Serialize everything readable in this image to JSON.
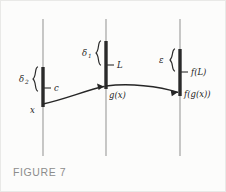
{
  "figure": {
    "caption": "FIGURE 7",
    "background_color": "#fcfcfb",
    "axis_color": "#9a9a9a",
    "bar_color": "#2a2a2a",
    "curve_color": "#262626",
    "caption_color": "#8c8c8c"
  },
  "axes": [
    {
      "id": "domain-axis",
      "x": 42,
      "y_top": 18,
      "y_bottom": 155
    },
    {
      "id": "intermediate-axis",
      "x": 105,
      "y_top": 18,
      "y_bottom": 155
    },
    {
      "id": "range-axis",
      "x": 179,
      "y_top": 18,
      "y_bottom": 155
    }
  ],
  "intervals": [
    {
      "id": "delta2-interval",
      "axis": "domain-axis",
      "x": 42,
      "y_top": 66,
      "y_bottom": 106
    },
    {
      "id": "delta1-interval",
      "axis": "intermediate-axis",
      "x": 105,
      "y_top": 40,
      "y_bottom": 88
    },
    {
      "id": "epsilon-interval",
      "axis": "range-axis",
      "x": 179,
      "y_top": 48,
      "y_bottom": 95
    }
  ],
  "braces": [
    {
      "id": "delta2-brace",
      "label": "δ",
      "subscript": "2",
      "x": 34,
      "y_top": 66,
      "y_bottom": 90,
      "label_x": 18,
      "label_y": 81,
      "sub_x": 24,
      "sub_y": 83
    },
    {
      "id": "delta1-brace",
      "label": "δ",
      "subscript": "1",
      "x": 97,
      "y_top": 40,
      "y_bottom": 64,
      "label_x": 81,
      "label_y": 55,
      "sub_x": 87,
      "sub_y": 57
    },
    {
      "id": "epsilon-brace",
      "label": "ε",
      "subscript": "",
      "x": 171,
      "y_top": 48,
      "y_bottom": 70,
      "label_x": 158,
      "label_y": 62,
      "sub_x": 0,
      "sub_y": 0
    }
  ],
  "tick_labels": [
    {
      "id": "label-c",
      "text": "c",
      "tick_x1": 42,
      "tick_x2": 50,
      "tick_y": 87,
      "text_x": 53,
      "text_y": 90
    },
    {
      "id": "label-L",
      "text": "L",
      "tick_x1": 105,
      "tick_x2": 113,
      "tick_y": 64,
      "text_x": 116,
      "text_y": 67
    },
    {
      "id": "label-fL",
      "text": "f(L)",
      "tick_x1": 179,
      "tick_x2": 187,
      "tick_y": 71,
      "text_x": 190,
      "text_y": 74
    }
  ],
  "points": [
    {
      "id": "point-x",
      "text": "x",
      "x": 42,
      "y": 103,
      "text_x": 29,
      "text_y": 112
    },
    {
      "id": "point-gx",
      "text": "g(x)",
      "x": 105,
      "y": 85,
      "text_x": 108,
      "text_y": 97
    },
    {
      "id": "point-fgx",
      "text": "f(g(x))",
      "x": 179,
      "y": 92,
      "text_x": 183,
      "text_y": 96
    }
  ],
  "curve": {
    "id": "mapping-curve",
    "start": {
      "x": 42,
      "y": 103
    },
    "mid": {
      "x": 105,
      "y": 85
    },
    "end": {
      "x": 179,
      "y": 92
    },
    "segment1_path": "M 42 103 C 62 99, 86 89, 103 85.6",
    "segment2_path": "M 105 85 C 128 82, 158 85, 176.5 91.2"
  },
  "arrowheads": [
    {
      "id": "arrowhead-gx",
      "points": "103,85.6 96,82.6 97.6,88.9"
    },
    {
      "id": "arrowhead-fgx",
      "points": "176.8,91.3 169.6,89 170.8,95.2"
    }
  ]
}
